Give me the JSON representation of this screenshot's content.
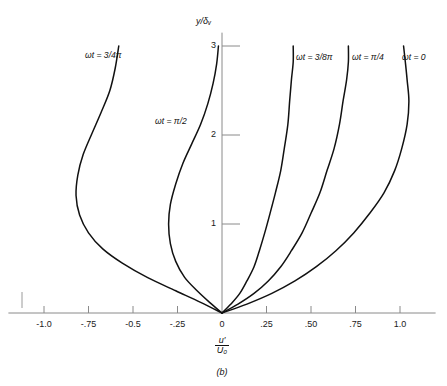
{
  "figure": {
    "caption": "(b)",
    "y_axis_label_html": "y/δᵥ",
    "x_axis_label_numerator": "u′",
    "x_axis_label_denominator": "U₀"
  },
  "axes": {
    "x_ticks": [
      "-1.0",
      "-.75",
      "-0.5",
      "-.25",
      "0",
      ".25",
      ".50",
      ".75",
      "1.0"
    ],
    "x_tick_values": [
      -1.0,
      -0.75,
      -0.5,
      -0.25,
      0,
      0.25,
      0.5,
      0.75,
      1.0
    ],
    "y_ticks": [
      "1",
      "2",
      "3"
    ],
    "y_tick_values": [
      1,
      2,
      3
    ],
    "xlim": [
      -1.2,
      1.2
    ],
    "ylim": [
      0,
      3.15
    ],
    "grid": false,
    "axis_color": "#8a8a8a",
    "curve_color": "#111111"
  },
  "curve_labels": [
    {
      "id": "wt-3-4-pi",
      "text": "ωt = 3/4π"
    },
    {
      "id": "wt-pi-2",
      "text": "ωt = π/2"
    },
    {
      "id": "wt-3-8-pi",
      "text": "ωt = 3/8π"
    },
    {
      "id": "wt-pi-4",
      "text": "ωt = π/4"
    },
    {
      "id": "wt-0",
      "text": "ωt = 0"
    }
  ],
  "chart_data": {
    "type": "line",
    "title": "",
    "subtitle": "",
    "xlabel": "u'/U0",
    "ylabel": "y/delta_v",
    "xlim": [
      -1.2,
      1.2
    ],
    "ylim": [
      0,
      3.15
    ],
    "grid": false,
    "legend": "inline curve labels at top of each curve",
    "series": [
      {
        "name": "ωt = 3/4π",
        "points": [
          [
            0.0,
            0.0
          ],
          [
            -0.12,
            0.12
          ],
          [
            -0.26,
            0.25
          ],
          [
            -0.42,
            0.4
          ],
          [
            -0.56,
            0.56
          ],
          [
            -0.67,
            0.72
          ],
          [
            -0.75,
            0.9
          ],
          [
            -0.8,
            1.1
          ],
          [
            -0.82,
            1.32
          ],
          [
            -0.81,
            1.55
          ],
          [
            -0.78,
            1.78
          ],
          [
            -0.73,
            2.02
          ],
          [
            -0.68,
            2.25
          ],
          [
            -0.63,
            2.5
          ],
          [
            -0.6,
            2.75
          ],
          [
            -0.58,
            3.0
          ]
        ]
      },
      {
        "name": "ωt = π/2",
        "points": [
          [
            0.0,
            0.0
          ],
          [
            -0.07,
            0.12
          ],
          [
            -0.14,
            0.25
          ],
          [
            -0.21,
            0.4
          ],
          [
            -0.26,
            0.58
          ],
          [
            -0.29,
            0.78
          ],
          [
            -0.3,
            1.0
          ],
          [
            -0.29,
            1.22
          ],
          [
            -0.26,
            1.45
          ],
          [
            -0.22,
            1.68
          ],
          [
            -0.17,
            1.9
          ],
          [
            -0.12,
            2.12
          ],
          [
            -0.08,
            2.35
          ],
          [
            -0.05,
            2.58
          ],
          [
            -0.03,
            2.8
          ],
          [
            -0.02,
            3.0
          ]
        ]
      },
      {
        "name": "ωt = 3/8π",
        "points": [
          [
            0.0,
            0.0
          ],
          [
            0.05,
            0.1
          ],
          [
            0.1,
            0.22
          ],
          [
            0.14,
            0.36
          ],
          [
            0.18,
            0.52
          ],
          [
            0.21,
            0.7
          ],
          [
            0.24,
            0.9
          ],
          [
            0.27,
            1.12
          ],
          [
            0.3,
            1.35
          ],
          [
            0.33,
            1.6
          ],
          [
            0.35,
            1.85
          ],
          [
            0.37,
            2.12
          ],
          [
            0.38,
            2.38
          ],
          [
            0.39,
            2.62
          ],
          [
            0.4,
            2.82
          ],
          [
            0.4,
            3.0
          ]
        ]
      },
      {
        "name": "ωt = π/4",
        "points": [
          [
            0.0,
            0.0
          ],
          [
            0.09,
            0.1
          ],
          [
            0.18,
            0.22
          ],
          [
            0.26,
            0.36
          ],
          [
            0.33,
            0.52
          ],
          [
            0.39,
            0.7
          ],
          [
            0.45,
            0.9
          ],
          [
            0.5,
            1.12
          ],
          [
            0.55,
            1.35
          ],
          [
            0.59,
            1.6
          ],
          [
            0.63,
            1.85
          ],
          [
            0.66,
            2.12
          ],
          [
            0.68,
            2.38
          ],
          [
            0.7,
            2.62
          ],
          [
            0.71,
            2.82
          ],
          [
            0.71,
            3.0
          ]
        ]
      },
      {
        "name": "ωt = 0",
        "points": [
          [
            0.0,
            0.0
          ],
          [
            0.14,
            0.1
          ],
          [
            0.28,
            0.22
          ],
          [
            0.41,
            0.36
          ],
          [
            0.53,
            0.52
          ],
          [
            0.64,
            0.7
          ],
          [
            0.74,
            0.9
          ],
          [
            0.83,
            1.12
          ],
          [
            0.91,
            1.35
          ],
          [
            0.97,
            1.6
          ],
          [
            1.01,
            1.85
          ],
          [
            1.04,
            2.12
          ],
          [
            1.05,
            2.38
          ],
          [
            1.04,
            2.62
          ],
          [
            1.03,
            2.82
          ],
          [
            1.02,
            3.0
          ]
        ]
      }
    ]
  }
}
